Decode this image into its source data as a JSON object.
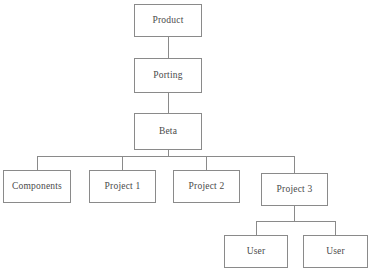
{
  "diagram": {
    "type": "tree-hierarchy",
    "background_color": "#ffffff",
    "box_border_color": "#8a8a8a",
    "connector_color": "#8a8a8a",
    "text_color": "#4a4a4a",
    "nodes": [
      {
        "id": "product",
        "label": "Product",
        "x": 134,
        "y": 4,
        "w": 68,
        "h": 33,
        "level": 0
      },
      {
        "id": "porting",
        "label": "Porting",
        "x": 134,
        "y": 58,
        "w": 68,
        "h": 35,
        "level": 1
      },
      {
        "id": "beta",
        "label": "Beta",
        "x": 134,
        "y": 113,
        "w": 68,
        "h": 37,
        "level": 2
      },
      {
        "id": "components",
        "label": "Components",
        "x": 3,
        "y": 170,
        "w": 68,
        "h": 33,
        "level": 3
      },
      {
        "id": "project1",
        "label": "Project 1",
        "x": 89,
        "y": 170,
        "w": 67,
        "h": 33,
        "level": 3
      },
      {
        "id": "project2",
        "label": "Project 2",
        "x": 173,
        "y": 170,
        "w": 67,
        "h": 33,
        "level": 3
      },
      {
        "id": "project3",
        "label": "Project 3",
        "x": 261,
        "y": 173,
        "w": 67,
        "h": 33,
        "level": 3
      },
      {
        "id": "user1",
        "label": "User",
        "x": 224,
        "y": 235,
        "w": 64,
        "h": 33,
        "level": 4
      },
      {
        "id": "user2",
        "label": "User",
        "x": 303,
        "y": 235,
        "w": 65,
        "h": 33,
        "level": 4
      }
    ],
    "edges": [
      {
        "from": "product",
        "to": "porting"
      },
      {
        "from": "porting",
        "to": "beta"
      },
      {
        "from": "beta",
        "to": "components"
      },
      {
        "from": "beta",
        "to": "project1"
      },
      {
        "from": "beta",
        "to": "project2"
      },
      {
        "from": "beta",
        "to": "project3"
      },
      {
        "from": "project3",
        "to": "user1"
      },
      {
        "from": "project3",
        "to": "user2"
      }
    ]
  }
}
